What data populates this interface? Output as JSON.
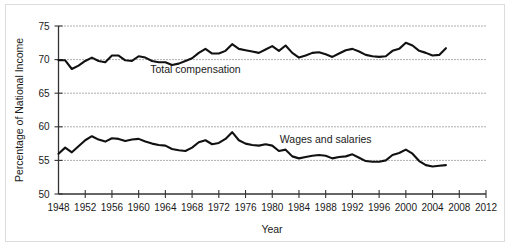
{
  "chart_data": {
    "type": "line",
    "title": "",
    "xlabel": "Year",
    "ylabel": "Percentage of National Income",
    "xlim": [
      1948,
      2012
    ],
    "ylim": [
      50,
      75
    ],
    "ytick_step": 5,
    "xtick_step": 4,
    "grid": "horizontal-dotted",
    "legend_position": "inline-annotation",
    "yticks": [
      "50",
      "55",
      "60",
      "65",
      "70",
      "75"
    ],
    "xticks": [
      "1948",
      "1952",
      "1956",
      "1960",
      "1964",
      "1968",
      "1972",
      "1976",
      "1980",
      "1984",
      "1988",
      "1992",
      "1996",
      "2000",
      "2004",
      "2008",
      "2012"
    ],
    "annotations": [
      {
        "text": "Total compensation",
        "x": 1968.5,
        "y": 68.0
      },
      {
        "text": "Wages and salaries",
        "x": 1988.0,
        "y": 57.6
      }
    ],
    "series": [
      {
        "name": "Total compensation",
        "color": "#111111",
        "x": [
          1948,
          1949,
          1950,
          1951,
          1952,
          1953,
          1954,
          1955,
          1956,
          1957,
          1958,
          1959,
          1960,
          1961,
          1962,
          1963,
          1964,
          1965,
          1966,
          1967,
          1968,
          1969,
          1970,
          1971,
          1972,
          1973,
          1974,
          1975,
          1976,
          1977,
          1978,
          1979,
          1980,
          1981,
          1982,
          1983,
          1984,
          1985,
          1986,
          1987,
          1988,
          1989,
          1990,
          1991,
          1992,
          1993,
          1994,
          1995,
          1996,
          1997,
          1998,
          1999,
          2000,
          2001,
          2002,
          2003,
          2004,
          2005,
          2006
        ],
        "values": [
          69.9,
          69.9,
          68.6,
          69.1,
          69.8,
          70.3,
          69.8,
          69.6,
          70.6,
          70.6,
          69.9,
          69.8,
          70.5,
          70.3,
          69.8,
          69.6,
          69.6,
          69.2,
          69.4,
          69.8,
          70.2,
          71.0,
          71.6,
          70.9,
          70.9,
          71.3,
          72.3,
          71.6,
          71.4,
          71.2,
          71.0,
          71.5,
          72.0,
          71.3,
          72.1,
          71.0,
          70.3,
          70.6,
          71.0,
          71.1,
          70.8,
          70.4,
          70.9,
          71.4,
          71.6,
          71.2,
          70.7,
          70.5,
          70.4,
          70.5,
          71.3,
          71.6,
          72.5,
          72.1,
          71.3,
          71.0,
          70.6,
          70.7,
          71.7
        ]
      },
      {
        "name": "Wages and salaries",
        "color": "#111111",
        "x": [
          1948,
          1949,
          1950,
          1951,
          1952,
          1953,
          1954,
          1955,
          1956,
          1957,
          1958,
          1959,
          1960,
          1961,
          1962,
          1963,
          1964,
          1965,
          1966,
          1967,
          1968,
          1969,
          1970,
          1971,
          1972,
          1973,
          1974,
          1975,
          1976,
          1977,
          1978,
          1979,
          1980,
          1981,
          1982,
          1983,
          1984,
          1985,
          1986,
          1987,
          1988,
          1989,
          1990,
          1991,
          1992,
          1993,
          1994,
          1995,
          1996,
          1997,
          1998,
          1999,
          2000,
          2001,
          2002,
          2003,
          2004,
          2005,
          2006
        ],
        "values": [
          56.0,
          56.9,
          56.2,
          57.1,
          58.0,
          58.6,
          58.1,
          57.8,
          58.3,
          58.2,
          57.9,
          58.1,
          58.2,
          57.8,
          57.5,
          57.3,
          57.2,
          56.7,
          56.5,
          56.4,
          56.9,
          57.7,
          58.0,
          57.4,
          57.6,
          58.2,
          59.2,
          58.0,
          57.5,
          57.3,
          57.2,
          57.4,
          57.2,
          56.4,
          56.6,
          55.6,
          55.3,
          55.5,
          55.7,
          55.8,
          55.7,
          55.3,
          55.5,
          55.6,
          55.9,
          55.4,
          54.9,
          54.8,
          54.8,
          55.0,
          55.8,
          56.1,
          56.6,
          56.0,
          54.9,
          54.3,
          54.1,
          54.2,
          54.3
        ]
      }
    ]
  }
}
